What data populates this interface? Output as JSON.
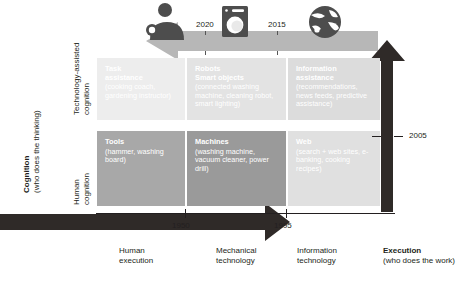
{
  "figure": {
    "type": "diagram"
  },
  "axes": {
    "y": {
      "title_bold": "Cognition",
      "title_sub": "(who does the thinking)",
      "categories": [
        {
          "line1": "Technology-assisted",
          "line2": "cognition"
        },
        {
          "line1": "Human",
          "line2": "cognition"
        }
      ]
    },
    "x": {
      "categories": [
        {
          "line1": "Human",
          "line2": "execution"
        },
        {
          "line1": "Mechanical",
          "line2": "technology"
        },
        {
          "line1": "Information",
          "line2": "technology"
        }
      ],
      "title_bold": "Execution",
      "title_sub": "(who does the work)"
    }
  },
  "years": {
    "top_left": "2020",
    "top_mid": "2015",
    "right": "2005",
    "bottom_left": "1950",
    "bottom_mid": "1995"
  },
  "icons": {
    "person": "person-icon",
    "washing_machine": "washing-machine-icon",
    "globe": "globe-icon",
    "arrow_left": "left-arrow",
    "arrow_right": "right-arrow",
    "arrow_up": "up-arrow"
  },
  "cells": [
    {
      "id": "task-assistance",
      "title": "Task",
      "title2": "assistance",
      "sub": "(cooking coach, gardening instructor)",
      "color": "#ededed"
    },
    {
      "id": "robots-smart-objects",
      "title": "Robots",
      "title2": "Smart objects",
      "sub": "(connected washing machine, cleaning robot, smart lighting)",
      "color": "#e3e3e3"
    },
    {
      "id": "information-assistance",
      "title": "Information",
      "title2": "assistance",
      "sub": "(recommendations, news feeds, predictive assistance)",
      "color": "#dcdcdc"
    },
    {
      "id": "tools",
      "title": "Tools",
      "title2": "",
      "sub": "(hammer, washing board)",
      "color": "#a8a8a8"
    },
    {
      "id": "machines",
      "title": "Machines",
      "title2": "",
      "sub": "(washing machine, vacuum cleaner, power drill)",
      "color": "#9a9a9a"
    },
    {
      "id": "web",
      "title": "Web",
      "title2": "",
      "sub": "(search + web sites, e-banking, cooking recipes)",
      "color": "#e0e0e0"
    }
  ],
  "colors": {
    "dark_arrow": "#2f2a28",
    "light_arrow": "#b7b7b7",
    "text": "#231f20",
    "cell_text": "#ffffff"
  }
}
